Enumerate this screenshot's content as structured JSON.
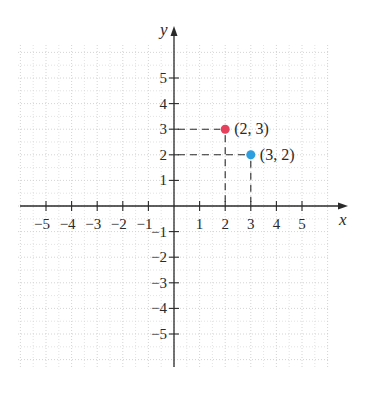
{
  "chart_data": {
    "type": "scatter",
    "title": "",
    "xlabel": "x",
    "ylabel": "y",
    "xlim": [
      -6,
      6
    ],
    "ylim": [
      -6,
      6
    ],
    "grid": true,
    "x_ticks": [
      -5,
      -4,
      -3,
      -2,
      -1,
      1,
      2,
      3,
      4,
      5
    ],
    "y_ticks": [
      -5,
      -4,
      -3,
      -2,
      -1,
      1,
      2,
      3,
      4,
      5
    ],
    "x_tick_labels": [
      "−5",
      "−4",
      "−3",
      "−2",
      "−1",
      "1",
      "2",
      "3",
      "4",
      "5"
    ],
    "y_tick_labels": [
      "−5",
      "−4",
      "−3",
      "−2",
      "−1",
      "1",
      "2",
      "3",
      "4",
      "5"
    ],
    "points": [
      {
        "x": 2,
        "y": 3,
        "label": "(2, 3)",
        "color": "#e5405c"
      },
      {
        "x": 3,
        "y": 2,
        "label": "(3, 2)",
        "color": "#2b9fe0"
      }
    ],
    "guides": "dashed lines from each point to both axes"
  },
  "colors": {
    "axis": "#2a2a2a",
    "grid": "#cfcfcf",
    "guide": "#2a2a2a"
  }
}
